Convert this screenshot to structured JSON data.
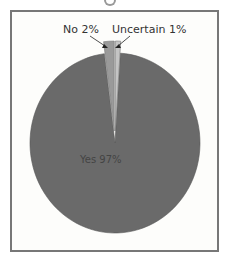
{
  "chart_data": {
    "type": "pie",
    "title": "",
    "categories": [
      "Yes",
      "No",
      "Uncertain"
    ],
    "values": [
      97,
      2,
      1
    ],
    "labels": [
      "Yes 97%",
      "No 2%",
      "Uncertain 1%"
    ],
    "colors": [
      "#6a6a6a",
      "#9a9a9a",
      "#c4c4c4"
    ],
    "exploded": [
      "No",
      "Uncertain"
    ],
    "legend": "none"
  }
}
